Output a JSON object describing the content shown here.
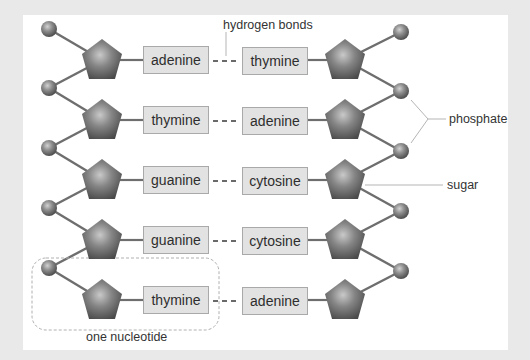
{
  "diagram": {
    "base_pairs": [
      {
        "left": "adenine",
        "right": "thymine"
      },
      {
        "left": "thymine",
        "right": "adenine"
      },
      {
        "left": "guanine",
        "right": "cytosine"
      },
      {
        "left": "guanine",
        "right": "cytosine"
      },
      {
        "left": "thymine",
        "right": "adenine"
      }
    ],
    "labels": {
      "hydrogen_bonds": "hydrogen bonds",
      "phosphate": "phosphate",
      "sugar": "sugar",
      "one_nucleotide": "one nucleotide"
    },
    "colors": {
      "background": "#e9e9e9",
      "panel": "#ffffff",
      "base_box_fill": "#e2e2e2",
      "base_box_border": "#a9a9a9",
      "backbone_line": "#6e6e6e",
      "molecule_gray": "#7a7a7a",
      "leader_line": "#b5b5b5"
    }
  }
}
